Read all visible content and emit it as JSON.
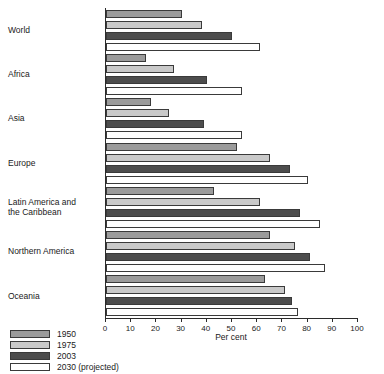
{
  "chart_data": {
    "type": "bar",
    "orientation": "horizontal",
    "title": "",
    "xlabel": "Per cent",
    "ylabel": "",
    "xlim": [
      0,
      100
    ],
    "xticks": [
      0,
      10,
      20,
      30,
      40,
      50,
      60,
      70,
      80,
      90,
      100
    ],
    "grid": false,
    "legend_position": "bottom-left",
    "categories": [
      "World",
      "Africa",
      "Asia",
      "Europe",
      "Latin America and\nthe Caribbean",
      "Northern America",
      "Oceania"
    ],
    "category_labels": [
      "World",
      "Africa",
      "Asia",
      "Europe",
      "Latin America and the Caribbean",
      "Northern America",
      "Oceania"
    ],
    "series": [
      {
        "name": "1950",
        "color": "#9b9b9b",
        "values": [
          30,
          16,
          18,
          52,
          43,
          65,
          63
        ]
      },
      {
        "name": "1975",
        "color": "#c9c9c9",
        "values": [
          38,
          27,
          25,
          65,
          61,
          75,
          71
        ]
      },
      {
        "name": "2003",
        "color": "#4d4d4d",
        "values": [
          50,
          40,
          39,
          73,
          77,
          81,
          74
        ]
      },
      {
        "name": "2030 (projected)",
        "color": "#ffffff",
        "values": [
          61,
          54,
          54,
          80,
          85,
          87,
          76
        ]
      }
    ]
  },
  "axis": {
    "x_title": "Per cent"
  },
  "legend": {
    "items": [
      {
        "label": "1950",
        "color": "#9b9b9b"
      },
      {
        "label": "1975",
        "color": "#c9c9c9"
      },
      {
        "label": "2003",
        "color": "#4d4d4d"
      },
      {
        "label": "2030 (projected)",
        "color": "#ffffff"
      }
    ]
  }
}
